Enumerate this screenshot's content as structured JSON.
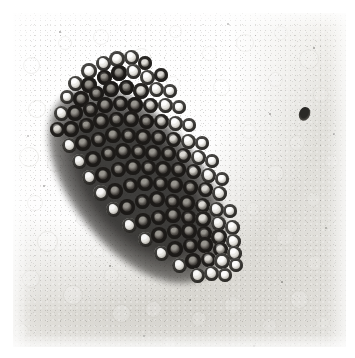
{
  "image": {
    "kind": "photomicrograph",
    "subject": "dense elongated cluster of round cells on a pale granular field",
    "width_px": 355,
    "height_px": 358,
    "border": {
      "color": "#ffffff",
      "left_px": 13,
      "top_px": 13,
      "right_px": 10,
      "bottom_px": 11
    },
    "plate": {
      "left_px": 13,
      "top_px": 13,
      "width_px": 333,
      "height_px": 334,
      "background_color": "#eeedea",
      "tone": "monochrome grayscale, slightly warm gray, visible film grain"
    },
    "palette": {
      "background_light": "#f6f5f3",
      "background_mid": "#eceae6",
      "background_dark": "#e3e1dc",
      "ghost_outline": "#c9c7c1",
      "cell_ring_dark": "#23211f",
      "cell_ring_mid": "#3c3a36",
      "cell_highlight": "#f4f3ef",
      "cluster_core": "#2a2826",
      "debris": "#2a2926"
    },
    "cluster": {
      "label": "cell-cluster",
      "orientation_deg": -39,
      "long_axis_px": 228,
      "short_axis_px": 128,
      "center_x_px": 124,
      "center_y_px": 172,
      "approx_cell_count": 118,
      "cell_diameter_px": [
        12,
        17
      ]
    },
    "debris_spot": {
      "x_px": 286,
      "y_px": 94,
      "width_px": 11,
      "height_px": 14
    },
    "background_cells": {
      "label": "ghost-cells",
      "description": "faint unstained erythrocyte-like outlines scattered across the field",
      "count": 46,
      "diameter_px": [
        12,
        22
      ]
    }
  },
  "ghost_cells": [
    {
      "x": 18,
      "y": 52,
      "d": 17,
      "o": 0.3,
      "w": 1.2
    },
    {
      "x": 52,
      "y": 30,
      "d": 14,
      "o": 0.22,
      "w": 1.0
    },
    {
      "x": 88,
      "y": 24,
      "d": 16,
      "o": 0.2,
      "w": 1.0
    },
    {
      "x": 128,
      "y": 44,
      "d": 19,
      "o": 0.26,
      "w": 1.2
    },
    {
      "x": 162,
      "y": 18,
      "d": 13,
      "o": 0.18,
      "w": 1.0
    },
    {
      "x": 196,
      "y": 40,
      "d": 15,
      "o": 0.17,
      "w": 1.0
    },
    {
      "x": 232,
      "y": 30,
      "d": 18,
      "o": 0.22,
      "w": 1.1
    },
    {
      "x": 268,
      "y": 20,
      "d": 14,
      "o": 0.16,
      "w": 1.0
    },
    {
      "x": 296,
      "y": 46,
      "d": 20,
      "o": 0.24,
      "w": 1.2
    },
    {
      "x": 308,
      "y": 82,
      "d": 16,
      "o": 0.2,
      "w": 1.0
    },
    {
      "x": 262,
      "y": 66,
      "d": 15,
      "o": 0.18,
      "w": 1.0
    },
    {
      "x": 208,
      "y": 74,
      "d": 17,
      "o": 0.19,
      "w": 1.0
    },
    {
      "x": 160,
      "y": 70,
      "d": 14,
      "o": 0.16,
      "w": 1.0
    },
    {
      "x": 24,
      "y": 96,
      "d": 18,
      "o": 0.28,
      "w": 1.2
    },
    {
      "x": 56,
      "y": 120,
      "d": 15,
      "o": 0.22,
      "w": 1.0
    },
    {
      "x": 16,
      "y": 144,
      "d": 20,
      "o": 0.34,
      "w": 1.4
    },
    {
      "x": 42,
      "y": 150,
      "d": 17,
      "o": 0.3,
      "w": 1.3
    },
    {
      "x": 22,
      "y": 190,
      "d": 16,
      "o": 0.24,
      "w": 1.1
    },
    {
      "x": 34,
      "y": 228,
      "d": 21,
      "o": 0.32,
      "w": 1.3
    },
    {
      "x": 70,
      "y": 206,
      "d": 14,
      "o": 0.2,
      "w": 1.0
    },
    {
      "x": 18,
      "y": 266,
      "d": 18,
      "o": 0.28,
      "w": 1.2
    },
    {
      "x": 60,
      "y": 282,
      "d": 20,
      "o": 0.34,
      "w": 1.4
    },
    {
      "x": 98,
      "y": 262,
      "d": 15,
      "o": 0.22,
      "w": 1.0
    },
    {
      "x": 108,
      "y": 300,
      "d": 19,
      "o": 0.36,
      "w": 1.4
    },
    {
      "x": 140,
      "y": 296,
      "d": 17,
      "o": 0.32,
      "w": 1.3
    },
    {
      "x": 150,
      "y": 264,
      "d": 14,
      "o": 0.2,
      "w": 1.0
    },
    {
      "x": 186,
      "y": 306,
      "d": 16,
      "o": 0.26,
      "w": 1.1
    },
    {
      "x": 220,
      "y": 292,
      "d": 18,
      "o": 0.24,
      "w": 1.1
    },
    {
      "x": 256,
      "y": 312,
      "d": 15,
      "o": 0.22,
      "w": 1.0
    },
    {
      "x": 286,
      "y": 286,
      "d": 19,
      "o": 0.26,
      "w": 1.2
    },
    {
      "x": 302,
      "y": 250,
      "d": 16,
      "o": 0.22,
      "w": 1.0
    },
    {
      "x": 272,
      "y": 224,
      "d": 18,
      "o": 0.24,
      "w": 1.1
    },
    {
      "x": 300,
      "y": 186,
      "d": 15,
      "o": 0.2,
      "w": 1.0
    },
    {
      "x": 262,
      "y": 160,
      "d": 17,
      "o": 0.26,
      "w": 1.2
    },
    {
      "x": 240,
      "y": 196,
      "d": 14,
      "o": 0.18,
      "w": 1.0
    },
    {
      "x": 284,
      "y": 130,
      "d": 16,
      "o": 0.2,
      "w": 1.0
    },
    {
      "x": 236,
      "y": 118,
      "d": 15,
      "o": 0.18,
      "w": 1.0
    },
    {
      "x": 196,
      "y": 258,
      "d": 14,
      "o": 0.18,
      "w": 1.0
    },
    {
      "x": 84,
      "y": 238,
      "d": 13,
      "o": 0.16,
      "w": 1.0
    },
    {
      "x": 118,
      "y": 196,
      "d": 12,
      "o": 0.14,
      "w": 1.0
    },
    {
      "x": 74,
      "y": 66,
      "d": 13,
      "o": 0.16,
      "w": 1.0
    },
    {
      "x": 174,
      "y": 118,
      "d": 13,
      "o": 0.14,
      "w": 1.0
    },
    {
      "x": 318,
      "y": 148,
      "d": 15,
      "o": 0.18,
      "w": 1.0
    },
    {
      "x": 310,
      "y": 310,
      "d": 14,
      "o": 0.18,
      "w": 1.0
    },
    {
      "x": 8,
      "y": 318,
      "d": 16,
      "o": 0.22,
      "w": 1.1
    },
    {
      "x": 156,
      "y": 330,
      "d": 15,
      "o": 0.2,
      "w": 1.0
    }
  ],
  "cluster_cells": [
    {
      "x": 76,
      "y": 58,
      "d": 16,
      "t": "rim"
    },
    {
      "x": 90,
      "y": 50,
      "d": 15,
      "t": "rim"
    },
    {
      "x": 104,
      "y": 46,
      "d": 16,
      "t": "rim"
    },
    {
      "x": 118,
      "y": 44,
      "d": 15,
      "t": "rim"
    },
    {
      "x": 132,
      "y": 50,
      "d": 14,
      "t": "dim"
    },
    {
      "x": 62,
      "y": 70,
      "d": 15,
      "t": "rim"
    },
    {
      "x": 76,
      "y": 72,
      "d": 16,
      "t": "dark"
    },
    {
      "x": 91,
      "y": 64,
      "d": 15,
      "t": "dark"
    },
    {
      "x": 106,
      "y": 60,
      "d": 16,
      "t": "dark"
    },
    {
      "x": 120,
      "y": 58,
      "d": 15,
      "t": "rim"
    },
    {
      "x": 134,
      "y": 64,
      "d": 15,
      "t": "rim"
    },
    {
      "x": 148,
      "y": 62,
      "d": 14,
      "t": "dim"
    },
    {
      "x": 54,
      "y": 84,
      "d": 14,
      "t": "rim"
    },
    {
      "x": 68,
      "y": 86,
      "d": 16,
      "t": "dark"
    },
    {
      "x": 83,
      "y": 80,
      "d": 15,
      "t": "dark"
    },
    {
      "x": 98,
      "y": 76,
      "d": 16,
      "t": "dark"
    },
    {
      "x": 113,
      "y": 74,
      "d": 15,
      "t": "dark"
    },
    {
      "x": 128,
      "y": 78,
      "d": 16,
      "t": "dim"
    },
    {
      "x": 143,
      "y": 76,
      "d": 15,
      "t": "rim"
    },
    {
      "x": 157,
      "y": 78,
      "d": 14,
      "t": "rim"
    },
    {
      "x": 48,
      "y": 100,
      "d": 15,
      "t": "rim"
    },
    {
      "x": 62,
      "y": 100,
      "d": 16,
      "t": "dark"
    },
    {
      "x": 77,
      "y": 96,
      "d": 15,
      "t": "dark"
    },
    {
      "x": 92,
      "y": 92,
      "d": 16,
      "t": "dark"
    },
    {
      "x": 107,
      "y": 90,
      "d": 15,
      "t": "dark"
    },
    {
      "x": 122,
      "y": 92,
      "d": 16,
      "t": "dark"
    },
    {
      "x": 137,
      "y": 92,
      "d": 15,
      "t": "dim"
    },
    {
      "x": 152,
      "y": 92,
      "d": 15,
      "t": "rim"
    },
    {
      "x": 166,
      "y": 94,
      "d": 14,
      "t": "rim"
    },
    {
      "x": 44,
      "y": 116,
      "d": 15,
      "t": "dim"
    },
    {
      "x": 58,
      "y": 116,
      "d": 16,
      "t": "dark"
    },
    {
      "x": 73,
      "y": 112,
      "d": 15,
      "t": "dark"
    },
    {
      "x": 88,
      "y": 108,
      "d": 16,
      "t": "dark"
    },
    {
      "x": 103,
      "y": 106,
      "d": 15,
      "t": "dark"
    },
    {
      "x": 118,
      "y": 106,
      "d": 16,
      "t": "dark"
    },
    {
      "x": 133,
      "y": 108,
      "d": 15,
      "t": "dark"
    },
    {
      "x": 148,
      "y": 108,
      "d": 15,
      "t": "dim"
    },
    {
      "x": 162,
      "y": 110,
      "d": 15,
      "t": "rim"
    },
    {
      "x": 176,
      "y": 112,
      "d": 14,
      "t": "rim"
    },
    {
      "x": 56,
      "y": 132,
      "d": 15,
      "t": "rim"
    },
    {
      "x": 70,
      "y": 130,
      "d": 16,
      "t": "dark"
    },
    {
      "x": 85,
      "y": 126,
      "d": 15,
      "t": "dark"
    },
    {
      "x": 100,
      "y": 122,
      "d": 16,
      "t": "dark"
    },
    {
      "x": 115,
      "y": 122,
      "d": 15,
      "t": "dark"
    },
    {
      "x": 130,
      "y": 124,
      "d": 16,
      "t": "dark"
    },
    {
      "x": 145,
      "y": 124,
      "d": 15,
      "t": "dark"
    },
    {
      "x": 160,
      "y": 126,
      "d": 15,
      "t": "dim"
    },
    {
      "x": 175,
      "y": 128,
      "d": 15,
      "t": "rim"
    },
    {
      "x": 189,
      "y": 130,
      "d": 14,
      "t": "rim"
    },
    {
      "x": 66,
      "y": 148,
      "d": 15,
      "t": "rim"
    },
    {
      "x": 80,
      "y": 146,
      "d": 16,
      "t": "dark"
    },
    {
      "x": 95,
      "y": 140,
      "d": 15,
      "t": "dark"
    },
    {
      "x": 110,
      "y": 138,
      "d": 16,
      "t": "dark"
    },
    {
      "x": 125,
      "y": 138,
      "d": 15,
      "t": "dark"
    },
    {
      "x": 140,
      "y": 140,
      "d": 16,
      "t": "dark"
    },
    {
      "x": 155,
      "y": 140,
      "d": 15,
      "t": "dark"
    },
    {
      "x": 170,
      "y": 142,
      "d": 15,
      "t": "dim"
    },
    {
      "x": 185,
      "y": 144,
      "d": 15,
      "t": "rim"
    },
    {
      "x": 199,
      "y": 148,
      "d": 14,
      "t": "rim"
    },
    {
      "x": 76,
      "y": 164,
      "d": 15,
      "t": "rim"
    },
    {
      "x": 90,
      "y": 162,
      "d": 16,
      "t": "dark"
    },
    {
      "x": 105,
      "y": 156,
      "d": 15,
      "t": "dark"
    },
    {
      "x": 120,
      "y": 154,
      "d": 16,
      "t": "dark"
    },
    {
      "x": 135,
      "y": 154,
      "d": 15,
      "t": "dark"
    },
    {
      "x": 150,
      "y": 156,
      "d": 16,
      "t": "dark"
    },
    {
      "x": 165,
      "y": 156,
      "d": 15,
      "t": "dark"
    },
    {
      "x": 180,
      "y": 158,
      "d": 15,
      "t": "dim"
    },
    {
      "x": 195,
      "y": 162,
      "d": 15,
      "t": "rim"
    },
    {
      "x": 209,
      "y": 166,
      "d": 14,
      "t": "rim"
    },
    {
      "x": 88,
      "y": 180,
      "d": 16,
      "t": "rim"
    },
    {
      "x": 102,
      "y": 178,
      "d": 16,
      "t": "dark"
    },
    {
      "x": 117,
      "y": 172,
      "d": 15,
      "t": "dark"
    },
    {
      "x": 132,
      "y": 170,
      "d": 16,
      "t": "dark"
    },
    {
      "x": 147,
      "y": 170,
      "d": 15,
      "t": "dark"
    },
    {
      "x": 162,
      "y": 172,
      "d": 16,
      "t": "dark"
    },
    {
      "x": 177,
      "y": 174,
      "d": 15,
      "t": "dark"
    },
    {
      "x": 192,
      "y": 176,
      "d": 15,
      "t": "dim"
    },
    {
      "x": 206,
      "y": 180,
      "d": 15,
      "t": "rim"
    },
    {
      "x": 100,
      "y": 196,
      "d": 15,
      "t": "rim"
    },
    {
      "x": 114,
      "y": 194,
      "d": 16,
      "t": "dark"
    },
    {
      "x": 129,
      "y": 188,
      "d": 15,
      "t": "dark"
    },
    {
      "x": 144,
      "y": 186,
      "d": 16,
      "t": "dark"
    },
    {
      "x": 159,
      "y": 188,
      "d": 15,
      "t": "dark"
    },
    {
      "x": 174,
      "y": 190,
      "d": 16,
      "t": "dark"
    },
    {
      "x": 189,
      "y": 192,
      "d": 15,
      "t": "dim"
    },
    {
      "x": 203,
      "y": 196,
      "d": 15,
      "t": "rim"
    },
    {
      "x": 217,
      "y": 198,
      "d": 14,
      "t": "rim"
    },
    {
      "x": 116,
      "y": 212,
      "d": 15,
      "t": "rim"
    },
    {
      "x": 130,
      "y": 208,
      "d": 16,
      "t": "dark"
    },
    {
      "x": 145,
      "y": 204,
      "d": 15,
      "t": "dark"
    },
    {
      "x": 160,
      "y": 202,
      "d": 16,
      "t": "dark"
    },
    {
      "x": 175,
      "y": 204,
      "d": 15,
      "t": "dark"
    },
    {
      "x": 190,
      "y": 206,
      "d": 16,
      "t": "dim"
    },
    {
      "x": 205,
      "y": 210,
      "d": 15,
      "t": "rim"
    },
    {
      "x": 219,
      "y": 214,
      "d": 15,
      "t": "rim"
    },
    {
      "x": 132,
      "y": 226,
      "d": 15,
      "t": "rim"
    },
    {
      "x": 146,
      "y": 222,
      "d": 16,
      "t": "dark"
    },
    {
      "x": 161,
      "y": 218,
      "d": 15,
      "t": "dark"
    },
    {
      "x": 176,
      "y": 218,
      "d": 16,
      "t": "dark"
    },
    {
      "x": 191,
      "y": 220,
      "d": 15,
      "t": "dark"
    },
    {
      "x": 206,
      "y": 224,
      "d": 16,
      "t": "dim"
    },
    {
      "x": 220,
      "y": 228,
      "d": 15,
      "t": "rim"
    },
    {
      "x": 148,
      "y": 240,
      "d": 15,
      "t": "rim"
    },
    {
      "x": 162,
      "y": 236,
      "d": 16,
      "t": "dark"
    },
    {
      "x": 177,
      "y": 232,
      "d": 15,
      "t": "dark"
    },
    {
      "x": 192,
      "y": 232,
      "d": 16,
      "t": "dark"
    },
    {
      "x": 207,
      "y": 236,
      "d": 15,
      "t": "dim"
    },
    {
      "x": 221,
      "y": 240,
      "d": 15,
      "t": "rim"
    },
    {
      "x": 166,
      "y": 252,
      "d": 15,
      "t": "rim"
    },
    {
      "x": 180,
      "y": 248,
      "d": 16,
      "t": "dark"
    },
    {
      "x": 195,
      "y": 246,
      "d": 15,
      "t": "dim"
    },
    {
      "x": 209,
      "y": 248,
      "d": 16,
      "t": "rim"
    },
    {
      "x": 223,
      "y": 252,
      "d": 14,
      "t": "rim"
    },
    {
      "x": 184,
      "y": 262,
      "d": 15,
      "t": "rim"
    },
    {
      "x": 198,
      "y": 260,
      "d": 15,
      "t": "rim"
    },
    {
      "x": 212,
      "y": 262,
      "d": 14,
      "t": "rim"
    }
  ],
  "flecks": [
    {
      "x": 46,
      "y": 18,
      "d": 2.0,
      "o": 0.45
    },
    {
      "x": 214,
      "y": 10,
      "d": 1.6,
      "o": 0.38
    },
    {
      "x": 300,
      "y": 34,
      "d": 1.8,
      "o": 0.4
    },
    {
      "x": 256,
      "y": 100,
      "d": 1.5,
      "o": 0.35
    },
    {
      "x": 320,
      "y": 120,
      "d": 2.0,
      "o": 0.42
    },
    {
      "x": 30,
      "y": 172,
      "d": 1.6,
      "o": 0.35
    },
    {
      "x": 252,
      "y": 140,
      "d": 1.4,
      "o": 0.3
    },
    {
      "x": 96,
      "y": 252,
      "d": 1.8,
      "o": 0.38
    },
    {
      "x": 176,
      "y": 286,
      "d": 1.5,
      "o": 0.33
    },
    {
      "x": 268,
      "y": 268,
      "d": 1.7,
      "o": 0.36
    },
    {
      "x": 130,
      "y": 322,
      "d": 1.6,
      "o": 0.34
    },
    {
      "x": 240,
      "y": 332,
      "d": 1.5,
      "o": 0.32
    },
    {
      "x": 66,
      "y": 340,
      "d": 1.4,
      "o": 0.3
    },
    {
      "x": 312,
      "y": 214,
      "d": 1.6,
      "o": 0.34
    },
    {
      "x": 14,
      "y": 122,
      "d": 1.5,
      "o": 0.32
    }
  ]
}
